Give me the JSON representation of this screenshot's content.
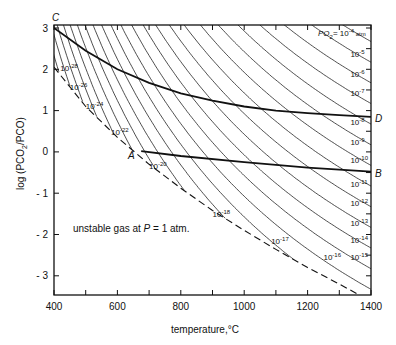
{
  "chart_data": {
    "type": "line",
    "title": "",
    "xlabel": "temperature,°C",
    "ylabel": "log (PCO2/PCO)",
    "xlim": [
      400,
      1400
    ],
    "ylim": [
      -3.45,
      3.05
    ],
    "x_ticks": [
      400,
      600,
      800,
      1000,
      1200,
      1400
    ],
    "x_minor_ticks": [
      500,
      700,
      900,
      1100,
      1300
    ],
    "y_ticks": [
      3,
      2,
      1,
      0,
      -1,
      -2,
      -3
    ],
    "y_tick_labels": [
      "3",
      "2",
      "1",
      "0",
      "- 1",
      "- 2",
      "- 3"
    ],
    "grid": false,
    "iso_po2_model": {
      "A": 12000,
      "B": 2.5,
      "note": "log(PCO2/PCO) = A/T(K) - B + 0.5*log PO2"
    },
    "iso_po2_exponents": [
      -4,
      -5,
      -6,
      -7,
      -8,
      -9,
      -10,
      -11,
      -12,
      -13,
      -14,
      -15,
      -16,
      -17,
      -18,
      -19,
      -20,
      -21,
      -22,
      -23,
      -24,
      -25,
      -26,
      -27,
      -28,
      -29,
      -30
    ],
    "iso_po2_labels": [
      {
        "text": "PO2 = 10-4 atm",
        "base": "10",
        "exp": "-4",
        "T": 1265,
        "y": 2.78,
        "prefix": "PO",
        "suffix": " atm"
      },
      {
        "exp": "-5",
        "T": 1335,
        "y": 2.3
      },
      {
        "exp": "-6",
        "T": 1335,
        "y": 1.82
      },
      {
        "exp": "-7",
        "T": 1335,
        "y": 1.36
      },
      {
        "exp": "-8",
        "T": 1335,
        "y": 0.66
      },
      {
        "exp": "-9",
        "T": 1335,
        "y": 0.16
      },
      {
        "exp": "-10",
        "T": 1335,
        "y": -0.27
      },
      {
        "exp": "-11",
        "T": 1335,
        "y": -0.84
      },
      {
        "exp": "-12",
        "T": 1335,
        "y": -1.3
      },
      {
        "exp": "-13",
        "T": 1335,
        "y": -1.8
      },
      {
        "exp": "-14",
        "T": 1335,
        "y": -2.2
      },
      {
        "exp": "-15",
        "T": 1335,
        "y": -2.62
      },
      {
        "exp": "-16",
        "T": 1250,
        "y": -2.62
      },
      {
        "exp": "-17",
        "T": 1085,
        "y": -2.22
      },
      {
        "exp": "-18",
        "T": 900,
        "y": -1.58
      },
      {
        "exp": "-20",
        "T": 700,
        "y": -0.42
      },
      {
        "exp": "-22",
        "T": 580,
        "y": 0.42
      },
      {
        "exp": "-24",
        "T": 500,
        "y": 1.05
      },
      {
        "exp": "-26",
        "T": 450,
        "y": 1.5
      },
      {
        "exp": "-28",
        "T": 420,
        "y": 1.95
      }
    ],
    "series": [
      {
        "name": "C-D",
        "style": "solid-bold",
        "points": [
          [
            400,
            3.0
          ],
          [
            500,
            2.45
          ],
          [
            600,
            2.0
          ],
          [
            700,
            1.67
          ],
          [
            800,
            1.42
          ],
          [
            900,
            1.24
          ],
          [
            1000,
            1.1
          ],
          [
            1100,
            1.0
          ],
          [
            1200,
            0.94
          ],
          [
            1300,
            0.89
          ],
          [
            1400,
            0.85
          ]
        ]
      },
      {
        "name": "A-B",
        "style": "solid-bold",
        "points": [
          [
            675,
            0.02
          ],
          [
            800,
            -0.1
          ],
          [
            1000,
            -0.25
          ],
          [
            1200,
            -0.38
          ],
          [
            1400,
            -0.48
          ]
        ]
      },
      {
        "name": "stability-boundary",
        "style": "dashed",
        "points": [
          [
            400,
            2.05
          ],
          [
            500,
            1.1
          ],
          [
            600,
            0.35
          ],
          [
            700,
            -0.3
          ],
          [
            800,
            -0.88
          ],
          [
            900,
            -1.42
          ],
          [
            1000,
            -1.9
          ],
          [
            1100,
            -2.36
          ],
          [
            1200,
            -2.8
          ],
          [
            1300,
            -3.2
          ],
          [
            1360,
            -3.45
          ]
        ]
      }
    ],
    "points": [
      {
        "name": "C",
        "T": 400,
        "y": 3.0
      },
      {
        "name": "D",
        "T": 1400,
        "y": 0.85
      },
      {
        "name": "A",
        "T": 675,
        "y": 0.0
      },
      {
        "name": "B",
        "T": 1400,
        "y": -0.48
      }
    ],
    "annotations": [
      {
        "text": "unstable gas at P = 1 atm.",
        "T": 430,
        "y": -1.82
      }
    ]
  },
  "labels": {
    "C": "C",
    "D": "D",
    "A": "A",
    "B": "B",
    "unstable": "unstable gas at ",
    "unstable_P": "P",
    "unstable_rest": " = 1 atm.",
    "xlabel": "temperature,°C",
    "ylabel_log": "log (PCO",
    "ylabel_sub": "2",
    "ylabel_rest": "/PCO)",
    "po2_prefix": "PO",
    "po2_sub": "2",
    "po2_eq": "= 10",
    "po2_exp": "-4",
    "po2_unit": " atm"
  }
}
